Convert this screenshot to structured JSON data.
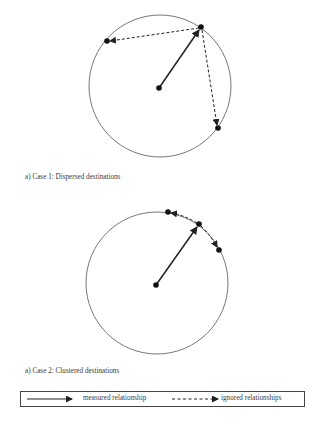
{
  "figures": [
    {
      "id": "case1",
      "caption": "a) Case 1: Dispersed destinations",
      "circle": {
        "cx": 160,
        "cy": 86,
        "r": 71
      },
      "origin": {
        "x": 159,
        "y": 88
      },
      "measured_destination": {
        "x": 201,
        "y": 27
      },
      "ignored_destinations": [
        {
          "x": 107,
          "y": 41
        },
        {
          "x": 218,
          "y": 128
        }
      ]
    },
    {
      "id": "case2",
      "caption": "a) Case 2: Clustered destinations",
      "circle": {
        "cx": 157,
        "cy": 283,
        "r": 71
      },
      "origin": {
        "x": 156,
        "y": 285
      },
      "measured_destination": {
        "x": 199,
        "y": 224
      },
      "ignored_destinations": [
        {
          "x": 168,
          "y": 212
        },
        {
          "x": 219,
          "y": 250
        }
      ]
    }
  ],
  "legend": {
    "measured_label": "measured relationship",
    "ignored_label": "ignored relationships"
  },
  "colors": {
    "stroke": "#222222",
    "circle": "#777777",
    "text": "#3a3a3a"
  }
}
